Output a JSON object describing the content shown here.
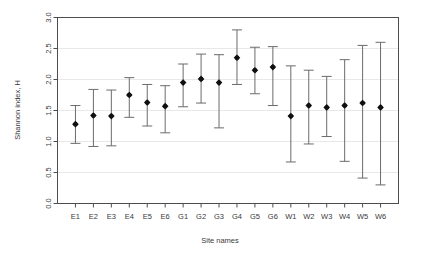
{
  "chart_data": {
    "type": "scatter",
    "title": "",
    "subtitle": "",
    "xlabel": "Site names",
    "ylabel": "Shannon index, H",
    "ylim": [
      0.0,
      3.0
    ],
    "yticks": [
      "0.0",
      "0.5",
      "1.0",
      "1.5",
      "2.0",
      "2.5",
      "3.0"
    ],
    "ytick_values": [
      0.0,
      0.5,
      1.0,
      1.5,
      2.0,
      2.5,
      3.0
    ],
    "grid": true,
    "grid_axis": "y",
    "legend": "none",
    "error_bars": "vertical with caps",
    "categories": [
      "E1",
      "E2",
      "E3",
      "E4",
      "E5",
      "E6",
      "G1",
      "G2",
      "G3",
      "G4",
      "G5",
      "G6",
      "W1",
      "W2",
      "W3",
      "W4",
      "W5",
      "W6"
    ],
    "values": [
      1.28,
      1.42,
      1.41,
      1.75,
      1.63,
      1.57,
      1.95,
      2.01,
      1.95,
      2.35,
      2.15,
      2.2,
      1.41,
      1.58,
      1.55,
      1.58,
      1.62,
      1.55
    ],
    "lower": [
      0.97,
      0.92,
      0.93,
      1.39,
      1.25,
      1.14,
      1.56,
      1.62,
      1.22,
      1.92,
      1.77,
      1.58,
      0.67,
      0.96,
      1.08,
      0.68,
      0.41,
      0.3
    ],
    "upper": [
      1.58,
      1.84,
      1.83,
      2.03,
      1.92,
      1.9,
      2.25,
      2.41,
      2.4,
      2.8,
      2.52,
      2.53,
      2.22,
      2.15,
      2.05,
      2.32,
      2.55,
      2.6
    ],
    "point_color": "#111111",
    "errorbar_color": "#6b6b6b",
    "grid_color": "#e8e8e8",
    "axis_color": "#4d4d4d",
    "background": "#ffffff"
  }
}
